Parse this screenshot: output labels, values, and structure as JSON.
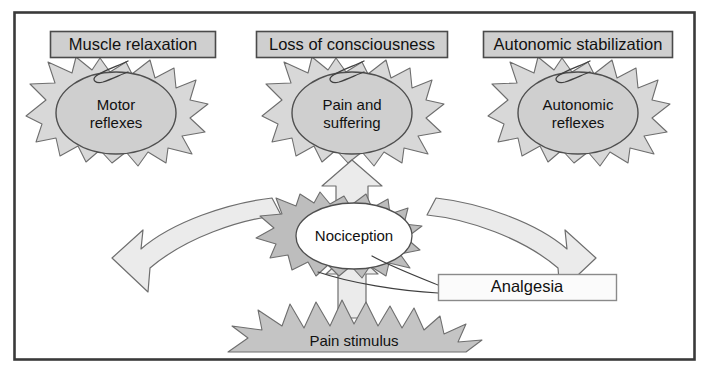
{
  "figure": {
    "frame_color": "#3a3a3a",
    "background": "#ffffff"
  },
  "colors": {
    "label_box_fill": "#cfcfcf",
    "label_box_stroke": "#4a4a4a",
    "starburst_fill": "#d8d8d8",
    "starburst_stroke": "#6e6e6e",
    "ellipse_fill": "#cfcfcf",
    "ellipse_stroke": "#4f4f4f",
    "center_starburst_fill": "#bdbdbd",
    "center_ellipse_fill": "#ffffff",
    "arrow_fill": "#ebebeb",
    "arrow_stroke": "#6e6e6e",
    "stimulus_fill": "#c4c4c4",
    "stimulus_stroke": "#6e6e6e",
    "analgesia_box_fill": "#fbfbfb",
    "analgesia_box_stroke": "#8a8a8a",
    "text_color": "#111111"
  },
  "labels": {
    "muscle_relaxation": "Muscle relaxation",
    "loss_of_consciousness": "Loss of consciousness",
    "autonomic_stabilization": "Autonomic stabilization",
    "analgesia": "Analgesia"
  },
  "nodes": {
    "motor_reflexes": {
      "line1": "Motor",
      "line2": "reflexes"
    },
    "pain_and_suffering": {
      "line1": "Pain and",
      "line2": "suffering"
    },
    "autonomic_reflexes": {
      "line1": "Autonomic",
      "line2": "reflexes"
    },
    "nociception": {
      "line1": "Nociception"
    },
    "pain_stimulus": {
      "line1": "Pain stimulus"
    }
  },
  "arrows": {
    "left_curved": "nociception-to-motor-reflexes",
    "center_straight": "nociception-to-pain-and-suffering",
    "right_curved": "nociception-to-autonomic-reflexes",
    "stimulus_up": "pain-stimulus-to-nociception"
  },
  "connectors": {
    "muscle_relaxation_pointer": "label-to-motor-reflexes",
    "loss_of_consciousness_pointer": "label-to-pain-and-suffering",
    "autonomic_stabilization_pointer": "label-to-autonomic-reflexes",
    "analgesia_pointer": "label-to-nociception"
  }
}
